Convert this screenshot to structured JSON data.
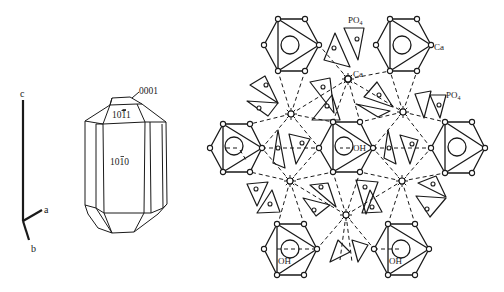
{
  "figure": {
    "axes": {
      "labels": {
        "c": "c",
        "a": "a",
        "b": "b"
      }
    },
    "crystal": {
      "faces": {
        "basal": "0001",
        "pyramid": "10Ī1",
        "prism": "10Ī0"
      },
      "face_labels_display": {
        "pyramid_prefix": "10",
        "pyramid_bar": "1",
        "pyramid_suffix": "1",
        "prism_prefix": "10",
        "prism_bar": "1",
        "prism_suffix": "0"
      }
    },
    "structure": {
      "labels": {
        "po4_top": "PO",
        "po4_top_sub": "4",
        "ca_star": "Ca",
        "ca_hex": "Ca",
        "po4_right": "PO",
        "po4_right_sub": "4",
        "oh_mid": "OH",
        "oh_bottom_left": "OH",
        "oh_bottom_right": "OH"
      },
      "hexagons": [
        {
          "id": "top-left",
          "cx": 291,
          "cy": 45
        },
        {
          "id": "top-right",
          "cx": 403,
          "cy": 45
        },
        {
          "id": "mid-left",
          "cx": 236,
          "cy": 148
        },
        {
          "id": "mid-center",
          "cx": 346,
          "cy": 148
        },
        {
          "id": "mid-right",
          "cx": 458,
          "cy": 148
        },
        {
          "id": "bottom-left",
          "cx": 290,
          "cy": 249
        },
        {
          "id": "bottom-right",
          "cx": 402,
          "cy": 249
        }
      ],
      "ca_sites": [
        {
          "x": 348,
          "y": 79
        },
        {
          "x": 291,
          "y": 114
        },
        {
          "x": 403,
          "y": 112
        },
        {
          "x": 290,
          "y": 181
        },
        {
          "x": 402,
          "y": 181
        },
        {
          "x": 346,
          "y": 215
        }
      ]
    }
  }
}
